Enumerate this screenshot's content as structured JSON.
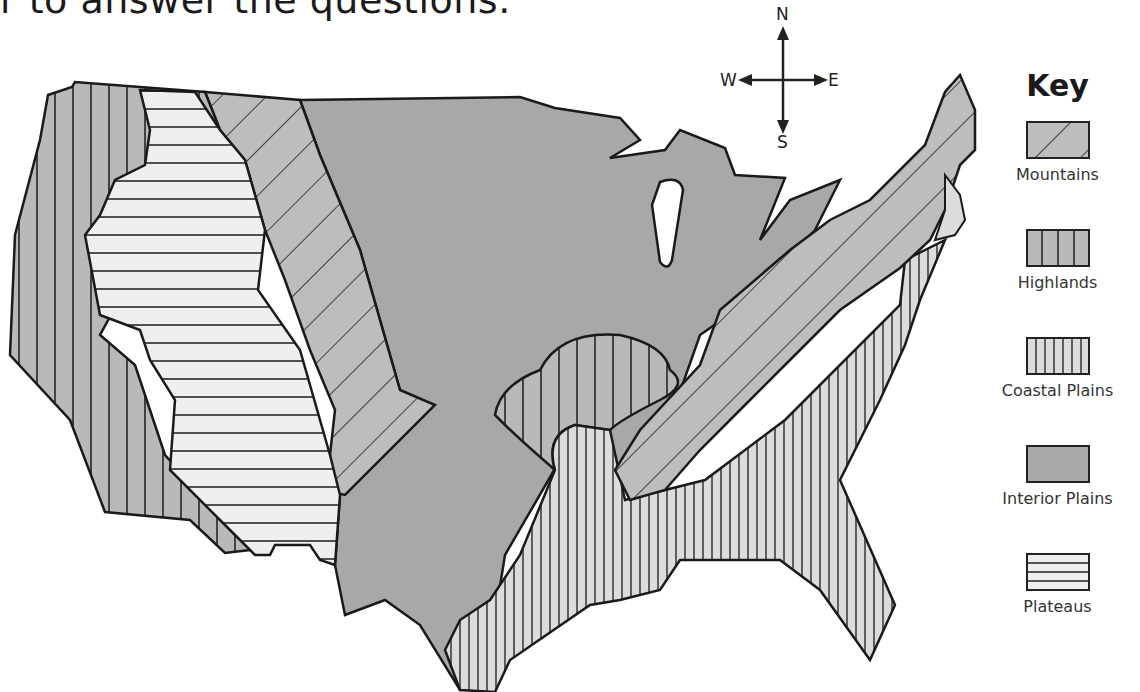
{
  "heading": "r to answer the questions.",
  "compass": {
    "north": "N",
    "south": "S",
    "east": "E",
    "west": "W"
  },
  "key": {
    "title": "Key",
    "items": [
      {
        "label": "Mountains",
        "pattern": "diagonal-hatch",
        "fill": "#bdbdbd"
      },
      {
        "label": "Highlands",
        "pattern": "wide-vertical-stripes",
        "fill": "#b9b9b9"
      },
      {
        "label": "Coastal Plains",
        "pattern": "narrow-vertical-stripes",
        "fill": "#dcdcdc"
      },
      {
        "label": "Interior Plains",
        "pattern": "solid",
        "fill": "#a8a8a8"
      },
      {
        "label": "Plateaus",
        "pattern": "horizontal-stripes",
        "fill": "#efefef"
      }
    ]
  },
  "map": {
    "subject": "Landform regions of the contiguous United States",
    "regions": [
      "Highlands (west coast)",
      "Plateaus (intermountain west)",
      "Mountains (Rocky Mountains)",
      "Interior Plains (central)",
      "Highlands (Ozarks)",
      "Coastal Plains (Gulf and Atlantic)",
      "Mountains (Appalachians)",
      "Highlands (New England)"
    ],
    "colors": {
      "outline": "#1a1a1a",
      "interior_plains": "#a8a8a8",
      "mountains": "#bdbdbd",
      "highlands": "#b9b9b9",
      "coastal_plains": "#dcdcdc",
      "plateaus": "#efefef",
      "water": "#ffffff"
    }
  }
}
